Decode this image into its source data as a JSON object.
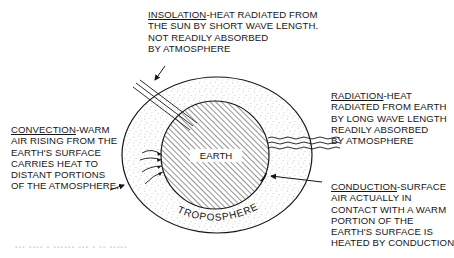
{
  "diagram": {
    "type": "heat-transfer-in-troposphere",
    "shapes": {
      "earth": {
        "cx": 215,
        "cy": 155,
        "r": 54,
        "fill": "diagonal-hatch"
      },
      "troposphere": {
        "cx": 217,
        "cy": 155,
        "rx": 95,
        "ry": 78,
        "fill": "stipple"
      }
    },
    "labels": {
      "earth": "EARTH",
      "troposphere": "TROPOSPHERE",
      "insolation": {
        "term": "INSOLATION",
        "lines": [
          "-HEAT RADIATED FROM",
          "THE SUN BY SHORT WAVE LENGTH.",
          "NOT READILY ABSORBED",
          "BY ATMOSPHERE"
        ]
      },
      "radiation": {
        "term": "RADIATION",
        "lines": [
          "-HEAT",
          "RADIATED FROM EARTH",
          "BY LONG WAVE LENGTH",
          "READILY ABSORBED",
          "BY ATMOSPHERE"
        ]
      },
      "convection": {
        "term": "CONVECTION",
        "lines": [
          "-WARM",
          "AIR RISING FROM THE",
          "EARTH'S SURFACE",
          "CARRIES HEAT TO",
          "DISTANT PORTIONS",
          "OF THE ATMOSPHERE."
        ]
      },
      "conduction": {
        "term": "CONDUCTION",
        "lines": [
          "-SURFACE",
          "AIR ACTUALLY IN",
          "CONTACT WITH A WARM",
          "PORTION OF THE",
          "EARTH'S  SURFACE IS",
          "HEATED BY CONDUCTION"
        ]
      }
    },
    "colors": {
      "ink": "#161616",
      "background": "#ffffff",
      "stipple": "#8a8a8a"
    }
  }
}
